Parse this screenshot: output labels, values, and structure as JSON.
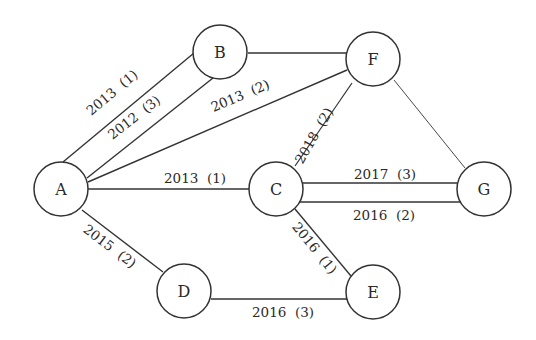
{
  "diagram": {
    "type": "graph",
    "style": {
      "background": "#ffffff",
      "stroke": "#333333",
      "text": "#2a2a2a",
      "node_radius": 27
    },
    "nodes": [
      {
        "id": "A",
        "label": "A",
        "x": 61,
        "y": 189
      },
      {
        "id": "B",
        "label": "B",
        "x": 220,
        "y": 52
      },
      {
        "id": "F",
        "label": "F",
        "x": 373,
        "y": 59
      },
      {
        "id": "C",
        "label": "C",
        "x": 276,
        "y": 189
      },
      {
        "id": "G",
        "label": "G",
        "x": 484,
        "y": 189
      },
      {
        "id": "D",
        "label": "D",
        "x": 184,
        "y": 291
      },
      {
        "id": "E",
        "label": "E",
        "x": 373,
        "y": 292
      }
    ],
    "edges": [
      {
        "from": "A",
        "to": "B",
        "label": "2013  (1)",
        "x1": 63,
        "y1": 162,
        "x2": 194,
        "y2": 53,
        "lx": 115,
        "ly": 96,
        "angle": -40,
        "w": 1.4
      },
      {
        "from": "A",
        "to": "B",
        "label": "2012  (3)",
        "x1": 87,
        "y1": 178,
        "x2": 213,
        "y2": 78,
        "lx": 137,
        "ly": 121,
        "angle": -38,
        "w": 1.4
      },
      {
        "from": "A",
        "to": "F",
        "label": "2013  (2)",
        "x1": 88,
        "y1": 182,
        "x2": 347,
        "y2": 70,
        "lx": 242,
        "ly": 100,
        "angle": -23,
        "w": 1.4
      },
      {
        "from": "B",
        "to": "F",
        "label": "",
        "x1": 248,
        "y1": 53,
        "x2": 347,
        "y2": 53,
        "lx": 0,
        "ly": 0,
        "angle": 0,
        "w": 1.4
      },
      {
        "from": "A",
        "to": "C",
        "label": "2013  (1)",
        "x1": 88,
        "y1": 189,
        "x2": 249,
        "y2": 189,
        "lx": 195,
        "ly": 183,
        "angle": 0,
        "w": 1.4
      },
      {
        "from": "C",
        "to": "F",
        "label": "2018  (2)",
        "x1": 295,
        "y1": 166,
        "x2": 352,
        "y2": 83,
        "lx": 318,
        "ly": 138,
        "angle": -60,
        "w": 1.2
      },
      {
        "from": "F",
        "to": "G",
        "label": "",
        "x1": 394,
        "y1": 80,
        "x2": 465,
        "y2": 168,
        "lx": 0,
        "ly": 0,
        "angle": 0,
        "w": 0.9
      },
      {
        "from": "C",
        "to": "G",
        "label": "2017  (3)",
        "x1": 302,
        "y1": 183,
        "x2": 457,
        "y2": 183,
        "lx": 385,
        "ly": 179,
        "angle": 0,
        "w": 1.4
      },
      {
        "from": "C",
        "to": "G",
        "label": "2016  (2)",
        "x1": 300,
        "y1": 202,
        "x2": 462,
        "y2": 202,
        "lx": 384,
        "ly": 220,
        "angle": 0,
        "w": 1.4
      },
      {
        "from": "C",
        "to": "E",
        "label": "2016  (1)",
        "x1": 295,
        "y1": 209,
        "x2": 351,
        "y2": 276,
        "lx": 311,
        "ly": 251,
        "angle": 51,
        "w": 1.4
      },
      {
        "from": "A",
        "to": "D",
        "label": "2015  (2)",
        "x1": 82,
        "y1": 210,
        "x2": 163,
        "y2": 272,
        "lx": 107,
        "ly": 250,
        "angle": 37,
        "w": 1.4
      },
      {
        "from": "D",
        "to": "E",
        "label": "2016  (3)",
        "x1": 211,
        "y1": 299,
        "x2": 347,
        "y2": 299,
        "lx": 283,
        "ly": 317,
        "angle": 0,
        "w": 1.4
      }
    ]
  }
}
